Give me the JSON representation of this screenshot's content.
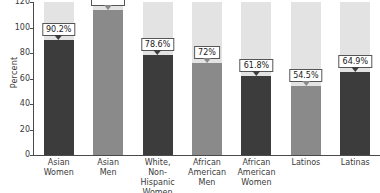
{
  "chart_data": {
    "type": "bar",
    "title": "",
    "xlabel": "",
    "ylabel": "Percent",
    "ylim": [
      0,
      120
    ],
    "yticks": [
      0,
      20,
      40,
      60,
      80,
      100,
      120
    ],
    "grid": false,
    "legend": "none",
    "categories": [
      "Asian Women",
      "Asian Men",
      "White, Non-Hispanic Women",
      "African American Men",
      "African American Women",
      "Latinos",
      "Latinas"
    ],
    "values": [
      90.2,
      114.0,
      78.6,
      72.0,
      61.8,
      54.5,
      64.9
    ],
    "data_labels": [
      "90.2%",
      "",
      "78.6%",
      "72%",
      "61.8%",
      "54.5%",
      "64.9%"
    ],
    "series": [
      {
        "name": "Percent",
        "values": [
          90.2,
          114.0,
          78.6,
          72.0,
          61.8,
          54.5,
          64.9
        ]
      }
    ],
    "background_bar_value": 120,
    "colors": {
      "women_bar": "#3c3c3c",
      "men_bar": "#8a8a8a",
      "background_bar": "#e3e3e3",
      "axis": "#4a4a4a",
      "text": "#3a3a3a",
      "callout_border": "#555555",
      "page_background": "#ffffff"
    }
  },
  "axis": {
    "y_title": "Percent",
    "y_tick_labels": [
      "120",
      "100",
      "80",
      "60",
      "40",
      "20",
      "0"
    ]
  },
  "bars": [
    {
      "id": "asian-women",
      "label_line1": "Asian",
      "label_line2": "Women",
      "label_line3": "",
      "value": 90.2,
      "data_label": "90.2%",
      "group": "women",
      "label_visible": true
    },
    {
      "id": "asian-men",
      "label_line1": "Asian",
      "label_line2": "Men",
      "label_line3": "",
      "value": 114.0,
      "data_label": "",
      "group": "men",
      "label_visible": false
    },
    {
      "id": "white-non-hispanic-women",
      "label_line1": "White,",
      "label_line2": "Non-Hispanic",
      "label_line3": "Women",
      "value": 78.6,
      "data_label": "78.6%",
      "group": "women",
      "label_visible": true
    },
    {
      "id": "african-american-men",
      "label_line1": "African",
      "label_line2": "American",
      "label_line3": "Men",
      "value": 72.0,
      "data_label": "72%",
      "group": "men",
      "label_visible": true
    },
    {
      "id": "african-american-women",
      "label_line1": "African",
      "label_line2": "American",
      "label_line3": "Women",
      "value": 61.8,
      "data_label": "61.8%",
      "group": "women",
      "label_visible": true
    },
    {
      "id": "latinos",
      "label_line1": "Latinos",
      "label_line2": "",
      "label_line3": "",
      "value": 54.5,
      "data_label": "54.5%",
      "group": "men",
      "label_visible": true
    },
    {
      "id": "latinas",
      "label_line1": "Latinas",
      "label_line2": "",
      "label_line3": "",
      "value": 64.9,
      "data_label": "64.9%",
      "group": "women",
      "label_visible": true
    }
  ]
}
